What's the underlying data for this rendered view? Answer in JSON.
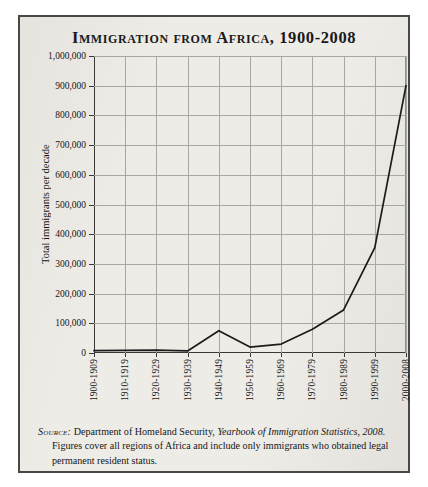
{
  "figure": {
    "title": "Immigration from Africa, 1900-2008"
  },
  "axes": {
    "y_title": "Total immigrants per decade",
    "y_ticks": [
      "1,000,000",
      "900,000",
      "800,000",
      "700,000",
      "600,000",
      "500,000",
      "400,000",
      "300,000",
      "200,000",
      "100,000",
      "0"
    ],
    "x_ticks": [
      "1900-1909",
      "1910-1919",
      "1920-1929",
      "1930-1939",
      "1940-1949",
      "1950-1959",
      "1960-1969",
      "1970-1979",
      "1980-1989",
      "1990-1999",
      "2000-2008"
    ]
  },
  "source": {
    "label": "Source:",
    "line1": " Department of Homeland Security, ",
    "italic_title": "Yearbook of Immigration Statistics, 2008.",
    "line2": " Figures cover all regions of Africa and include only immigrants who obtained legal permanent resident status."
  },
  "colors": {
    "line": "#1b1b1b",
    "grid": "#a9a7a2",
    "axis": "#393836",
    "frame": "#4a4846",
    "background": "#eeece7"
  },
  "chart_data": {
    "type": "line",
    "title": "Immigration from Africa, 1900-2008",
    "xlabel": "",
    "ylabel": "Total immigrants per decade",
    "categories": [
      "1900-1909",
      "1910-1919",
      "1920-1929",
      "1930-1939",
      "1940-1949",
      "1950-1959",
      "1960-1969",
      "1970-1979",
      "1980-1989",
      "1990-1999",
      "2000-2008"
    ],
    "values": [
      8000,
      9000,
      10000,
      7000,
      75000,
      20000,
      30000,
      80000,
      145000,
      355000,
      900000
    ],
    "ylim": [
      0,
      1000000
    ],
    "ytick_values": [
      0,
      100000,
      200000,
      300000,
      400000,
      500000,
      600000,
      700000,
      800000,
      900000,
      1000000
    ],
    "grid": true,
    "legend": false,
    "series": [
      {
        "name": "Total immigrants per decade",
        "values": [
          8000,
          9000,
          10000,
          7000,
          75000,
          20000,
          30000,
          80000,
          145000,
          355000,
          900000
        ]
      }
    ]
  }
}
